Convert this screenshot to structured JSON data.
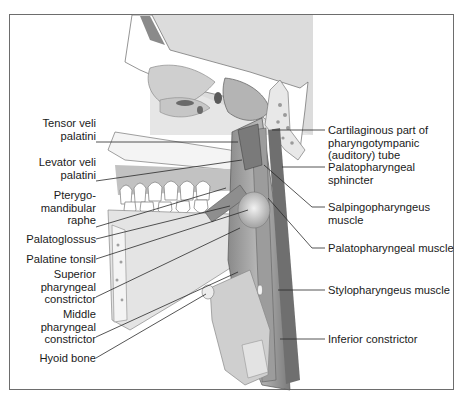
{
  "figure": {
    "frame_color": "#6d6d6d",
    "left_labels": [
      {
        "id": "tensor-veli-palatini",
        "text": "Tensor veli\npalatini",
        "x": 96,
        "y": 117,
        "ly": 142
      },
      {
        "id": "levator-veli-palatini",
        "text": "Levator veli\npalatini",
        "x": 96,
        "y": 157,
        "ly": 181
      },
      {
        "id": "pterygomandibular-raphe",
        "text": "Pterygo-\nmandibular\nraphe",
        "x": 96,
        "y": 190,
        "ly": 227
      },
      {
        "id": "palatoglossus",
        "text": "Palatoglossus",
        "x": 96,
        "y": 232,
        "ly": 239
      },
      {
        "id": "palatine-tonsil",
        "text": "Palatine tonsil",
        "x": 96,
        "y": 252,
        "ly": 259
      },
      {
        "id": "superior-pharyngeal-constrictor",
        "text": "Superior\npharyngeal\nconstrictor",
        "x": 96,
        "y": 269,
        "ly": 297
      },
      {
        "id": "middle-pharyngeal-constrictor",
        "text": "Middle\npharyngeal\nconstrictor",
        "x": 96,
        "y": 309,
        "ly": 337
      },
      {
        "id": "hyoid-bone",
        "text": "Hyoid bone",
        "x": 96,
        "y": 351,
        "ly": 358
      }
    ],
    "right_labels": [
      {
        "id": "cartilaginous-pharyngotympanic-tube",
        "text": "Cartilaginous part of\npharyngotympanic\n(auditory) tube",
        "x": 327,
        "y": 124,
        "ly": 130
      },
      {
        "id": "palatopharyngeal-sphincter",
        "text": "Palatopharyngeal\nsphincter",
        "x": 327,
        "y": 161,
        "ly": 167
      },
      {
        "id": "salpingopharyngeus-muscle",
        "text": "Salpingopharyngeus\nmuscle",
        "x": 327,
        "y": 201,
        "ly": 207
      },
      {
        "id": "palatopharyngeal-muscle",
        "text": "Palatopharyngeal muscle",
        "x": 327,
        "y": 242,
        "ly": 248
      },
      {
        "id": "stylopharyngeus-muscle",
        "text": "Stylopharyngeus muscle",
        "x": 327,
        "y": 284,
        "ly": 290
      },
      {
        "id": "inferior-constrictor",
        "text": "Inferior constrictor",
        "x": 327,
        "y": 333,
        "ly": 339
      }
    ]
  }
}
